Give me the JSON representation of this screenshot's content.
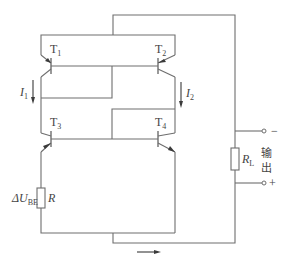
{
  "diagram": {
    "type": "circuit-schematic",
    "transistors": [
      {
        "id": "T1",
        "label": "T",
        "sub": "1"
      },
      {
        "id": "T2",
        "label": "T",
        "sub": "2"
      },
      {
        "id": "T3",
        "label": "T",
        "sub": "3"
      },
      {
        "id": "T4",
        "label": "T",
        "sub": "4"
      }
    ],
    "currents": [
      {
        "id": "I1",
        "label": "I",
        "sub": "1"
      },
      {
        "id": "I2",
        "label": "I",
        "sub": "2"
      }
    ],
    "resistor_r": {
      "label": "R"
    },
    "delta_ube": {
      "prefix": "ΔU",
      "sub": "BE"
    },
    "load": {
      "label": "R",
      "sub": "L"
    },
    "output": {
      "label_line1": "输",
      "label_line2": "出",
      "minus": "−",
      "plus": "+"
    },
    "colors": {
      "wire": "#6e6e6e",
      "text": "#444444"
    }
  }
}
